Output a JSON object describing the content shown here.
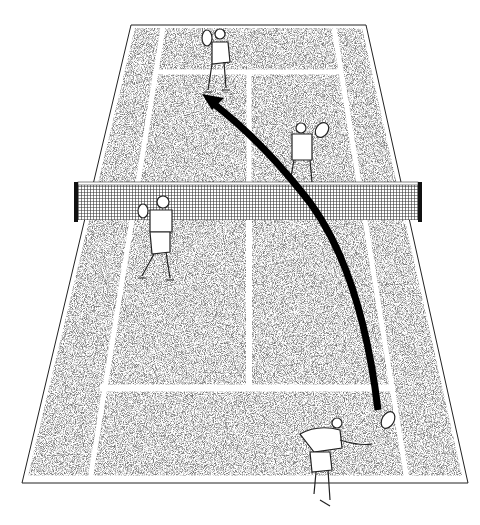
{
  "colors": {
    "court_texture": "#8a8a8a",
    "lines": "#ffffff",
    "outline": "#222222",
    "net": "#333333",
    "trajectory": "#000000"
  },
  "court": {
    "far_baseline": {
      "x1": 131,
      "x2": 366,
      "y": 25
    },
    "near_baseline": {
      "x1": 22,
      "x2": 468,
      "y": 483
    },
    "net": {
      "y_top": 183,
      "y_bottom": 220,
      "x1": 75,
      "x2": 421
    }
  },
  "players": [
    {
      "id": "far-left-player",
      "x": 215,
      "y": 60
    },
    {
      "id": "far-right-player",
      "x": 300,
      "y": 150
    },
    {
      "id": "near-net-player",
      "x": 158,
      "y": 240
    },
    {
      "id": "near-baseline-player",
      "x": 325,
      "y": 440
    }
  ],
  "trajectory": {
    "from": {
      "x": 378,
      "y": 410
    },
    "to": {
      "x": 205,
      "y": 100
    },
    "arrowhead": "arrow-up-left"
  }
}
